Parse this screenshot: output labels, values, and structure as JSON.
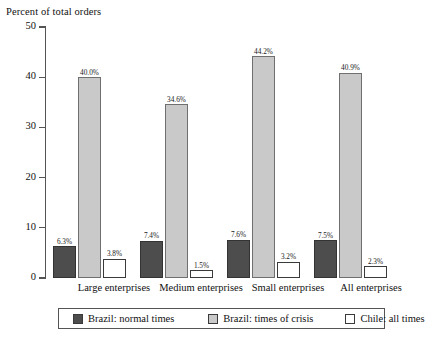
{
  "chart_data": {
    "type": "bar",
    "title": "",
    "ylabel": "Percent of total orders",
    "xlabel": "",
    "ylim": [
      0,
      50
    ],
    "yticks": [
      0,
      10,
      20,
      30,
      40,
      50
    ],
    "grid": false,
    "legend_position": "bottom",
    "categories": [
      "Large enterprises",
      "Medium enterprises",
      "Small enterprises",
      "All enterprises"
    ],
    "series": [
      {
        "name": "Brazil: normal times",
        "color": "#4d4d4d",
        "values": [
          6.3,
          7.4,
          7.6,
          7.5
        ],
        "labels": [
          "6.3%",
          "7.4%",
          "7.6%",
          "7.5%"
        ]
      },
      {
        "name": "Brazil: times of crisis",
        "color": "#c9c9c9",
        "values": [
          40.0,
          34.6,
          44.2,
          40.9
        ],
        "labels": [
          "40.0%",
          "34.6%",
          "44.2%",
          "40.9%"
        ]
      },
      {
        "name": "Chile: all times",
        "color": "#ffffff",
        "values": [
          3.8,
          1.5,
          3.2,
          2.3
        ],
        "labels": [
          "3.8%",
          "1.5%",
          "3.2%",
          "2.3%"
        ]
      }
    ]
  },
  "axis": {
    "y_title": "Percent of total orders",
    "tick_labels": [
      "50",
      "40",
      "30",
      "20",
      "10",
      "0"
    ]
  },
  "legend": {
    "items": [
      {
        "label": "Brazil: normal times",
        "swatch": "dark"
      },
      {
        "label": "Brazil: times of crisis",
        "swatch": "light"
      },
      {
        "label": "Chile: all times",
        "swatch": "white"
      }
    ]
  }
}
